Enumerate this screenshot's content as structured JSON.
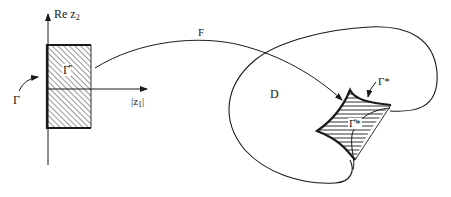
{
  "diagram": {
    "type": "complex-domain-mapping",
    "left_panel": {
      "vertical_axis_label": "Re z",
      "vertical_axis_sub": "2",
      "horizontal_axis_label": "|z",
      "horizontal_axis_sub": "1",
      "horizontal_axis_suffix": "|",
      "region_label": "Γ̂",
      "boundary_label": "Γ"
    },
    "mapping": {
      "label": "F"
    },
    "right_panel": {
      "domain_label": "D",
      "boundary_label": "Γ*",
      "region_label": "Γ̂*"
    },
    "colors": {
      "ink": "#1a1a1a",
      "background": "#ffffff"
    }
  }
}
